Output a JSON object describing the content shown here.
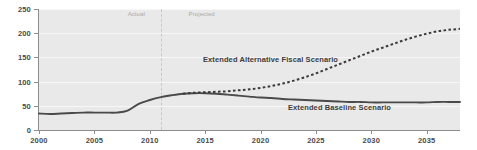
{
  "chart_data": {
    "type": "line",
    "title": "",
    "subtitle": "",
    "xlabel": "",
    "ylabel": "",
    "xlim": [
      2000,
      2038
    ],
    "ylim": [
      0,
      250
    ],
    "grid": true,
    "legend_position": "inline-annotations",
    "y_ticks": [
      0,
      50,
      100,
      150,
      200,
      250
    ],
    "y_tick_labels": [
      "0",
      "50",
      "100",
      "150",
      "200",
      "250"
    ],
    "x_ticks": [
      2000,
      2005,
      2010,
      2015,
      2020,
      2025,
      2030,
      2035
    ],
    "x_tick_labels": [
      "2000",
      "2005",
      "2010",
      "2015",
      "2020",
      "2025",
      "2030",
      "2035"
    ],
    "annotations": [
      {
        "name": "actual-label",
        "text": "Actual",
        "x": 2008.0,
        "y": 238
      },
      {
        "name": "projected-label",
        "text": "Projected",
        "x": 2013.5,
        "y": 238
      }
    ],
    "divider": {
      "x": 2011,
      "style": "dashed",
      "label_left": "Actual",
      "label_right": "Projected"
    },
    "x": [
      2000,
      2001,
      2002,
      2003,
      2004,
      2005,
      2006,
      2007,
      2008,
      2009,
      2010,
      2011,
      2012,
      2013,
      2014,
      2015,
      2016,
      2017,
      2018,
      2019,
      2020,
      2021,
      2022,
      2023,
      2024,
      2025,
      2026,
      2027,
      2028,
      2029,
      2030,
      2031,
      2032,
      2033,
      2034,
      2035,
      2036,
      2037,
      2038
    ],
    "series": [
      {
        "name": "Extended Baseline Scenario",
        "label": "Extended Baseline Scenario",
        "style": "solid",
        "color": "#4a4a4a",
        "values": [
          34,
          33,
          34,
          35,
          36,
          36,
          36,
          36,
          40,
          54,
          62,
          68,
          72,
          75,
          76,
          76,
          75,
          73,
          71,
          69,
          67,
          66,
          64,
          63,
          62,
          61,
          60,
          59,
          58,
          58,
          57,
          57,
          57,
          57,
          57,
          57,
          58,
          58,
          58
        ]
      },
      {
        "name": "Extended Alternative Fiscal Scenario",
        "label": "Extended Alternative Fiscal Scenario",
        "style": "dashed",
        "color": "#3a3a3a",
        "values": [
          null,
          null,
          null,
          null,
          null,
          null,
          null,
          null,
          null,
          null,
          null,
          null,
          null,
          75,
          77,
          78,
          79,
          80,
          82,
          84,
          87,
          91,
          96,
          102,
          109,
          117,
          126,
          135,
          144,
          153,
          162,
          170,
          178,
          186,
          193,
          199,
          204,
          207,
          209
        ]
      }
    ]
  }
}
